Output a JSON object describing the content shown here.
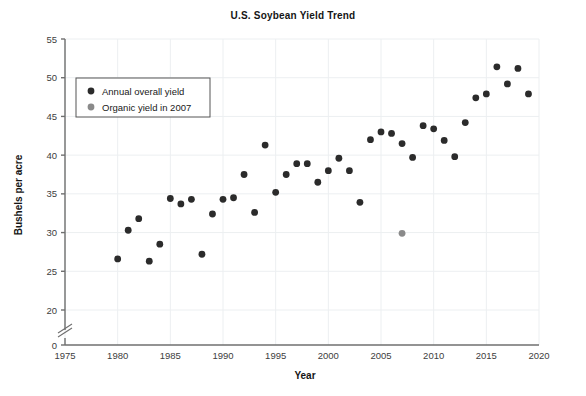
{
  "chart_data": {
    "type": "scatter",
    "title": "U.S. Soybean Yield Trend",
    "xlabel": "Year",
    "ylabel": "Bushels per acre",
    "xlim": [
      1975,
      2020
    ],
    "ylim": [
      0,
      55
    ],
    "y_axis_break": true,
    "y_break_between": [
      0,
      20
    ],
    "grid": true,
    "legend_position": "upper-left",
    "xticks": [
      1975,
      1980,
      1985,
      1990,
      1995,
      2000,
      2005,
      2010,
      2015,
      2020
    ],
    "yticks": [
      0,
      20,
      25,
      30,
      35,
      40,
      45,
      50,
      55
    ],
    "series": [
      {
        "name": "Annual overall yield",
        "color": "#2b2b2b",
        "marker": "circle",
        "points": [
          {
            "x": 1980,
            "y": 26.6
          },
          {
            "x": 1981,
            "y": 30.3
          },
          {
            "x": 1982,
            "y": 31.8
          },
          {
            "x": 1983,
            "y": 26.3
          },
          {
            "x": 1984,
            "y": 28.5
          },
          {
            "x": 1985,
            "y": 34.4
          },
          {
            "x": 1986,
            "y": 33.7
          },
          {
            "x": 1987,
            "y": 34.3
          },
          {
            "x": 1988,
            "y": 27.2
          },
          {
            "x": 1989,
            "y": 32.4
          },
          {
            "x": 1990,
            "y": 34.3
          },
          {
            "x": 1991,
            "y": 34.5
          },
          {
            "x": 1992,
            "y": 37.5
          },
          {
            "x": 1993,
            "y": 32.6
          },
          {
            "x": 1994,
            "y": 41.3
          },
          {
            "x": 1995,
            "y": 35.2
          },
          {
            "x": 1996,
            "y": 37.5
          },
          {
            "x": 1997,
            "y": 38.9
          },
          {
            "x": 1998,
            "y": 38.9
          },
          {
            "x": 1999,
            "y": 36.5
          },
          {
            "x": 2000,
            "y": 38.0
          },
          {
            "x": 2001,
            "y": 39.6
          },
          {
            "x": 2002,
            "y": 38.0
          },
          {
            "x": 2003,
            "y": 33.9
          },
          {
            "x": 2004,
            "y": 42.0
          },
          {
            "x": 2005,
            "y": 43.0
          },
          {
            "x": 2006,
            "y": 42.8
          },
          {
            "x": 2007,
            "y": 41.5
          },
          {
            "x": 2008,
            "y": 39.7
          },
          {
            "x": 2009,
            "y": 43.8
          },
          {
            "x": 2010,
            "y": 43.4
          },
          {
            "x": 2011,
            "y": 41.9
          },
          {
            "x": 2012,
            "y": 39.8
          },
          {
            "x": 2013,
            "y": 44.2
          },
          {
            "x": 2014,
            "y": 47.4
          },
          {
            "x": 2015,
            "y": 47.9
          },
          {
            "x": 2016,
            "y": 51.4
          },
          {
            "x": 2017,
            "y": 49.2
          },
          {
            "x": 2018,
            "y": 51.2
          },
          {
            "x": 2019,
            "y": 47.9
          }
        ]
      },
      {
        "name": "Organic yield in 2007",
        "color": "#8a8a8a",
        "marker": "circle",
        "points": [
          {
            "x": 2007,
            "y": 29.9
          }
        ]
      }
    ]
  },
  "legend": {
    "entries": [
      {
        "label": "Annual overall yield",
        "color": "#2b2b2b"
      },
      {
        "label": "Organic yield in 2007",
        "color": "#8a8a8a"
      }
    ]
  },
  "colors": {
    "background": "#ffffff",
    "grid": "#eceff1",
    "axis": "#6f6f6f",
    "text": "#151515",
    "tick_text": "#404040"
  }
}
